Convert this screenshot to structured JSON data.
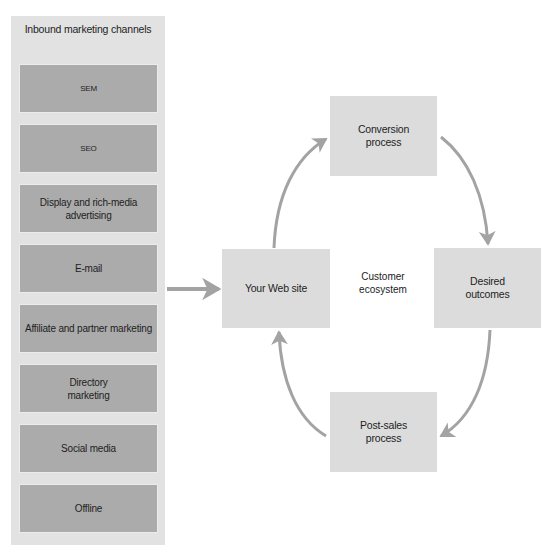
{
  "column": {
    "title": "Inbound marketing channels",
    "channels": [
      {
        "label": "SEM",
        "size": "small"
      },
      {
        "label": "SEO",
        "size": "small"
      },
      {
        "label": "Display and rich-media\nadvertising",
        "size": "normal"
      },
      {
        "label": "E-mail",
        "size": "normal"
      },
      {
        "label": "Affiliate and partner marketing",
        "size": "normal"
      },
      {
        "label": "Directory\nmarketing",
        "size": "normal"
      },
      {
        "label": "Social media",
        "size": "normal"
      },
      {
        "label": "Offline",
        "size": "normal"
      }
    ]
  },
  "nodes": {
    "website": "Your Web site",
    "conversion": "Conversion\nprocess",
    "outcomes": "Desired\noutcomes",
    "postsales": "Post-sales\nprocess"
  },
  "center_label": "Customer\necosystem",
  "colors": {
    "column_bg": "#e2e2e2",
    "channel_bg": "#ababab",
    "node_bg": "#dcdcdc",
    "arrow": "#a3a3a3"
  },
  "edges": [
    {
      "from": "inbound-channels",
      "to": "website"
    },
    {
      "from": "website",
      "to": "conversion"
    },
    {
      "from": "conversion",
      "to": "outcomes"
    },
    {
      "from": "outcomes",
      "to": "postsales"
    },
    {
      "from": "postsales",
      "to": "website"
    }
  ]
}
